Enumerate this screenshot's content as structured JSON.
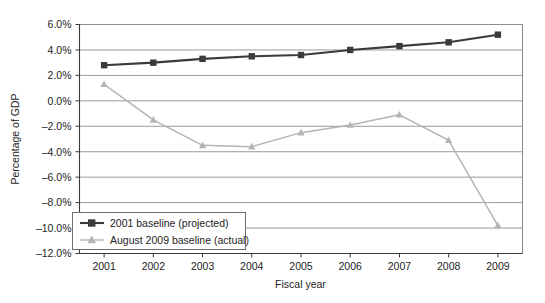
{
  "chart_data": {
    "type": "line",
    "title": "",
    "xlabel": "Fiscal year",
    "ylabel": "Percentage of GDP",
    "categories": [
      "2001",
      "2002",
      "2003",
      "2004",
      "2005",
      "2006",
      "2007",
      "2008",
      "2009"
    ],
    "x": [
      2001,
      2002,
      2003,
      2004,
      2005,
      2006,
      2007,
      2008,
      2009
    ],
    "series": [
      {
        "name": "2001 baseline (projected)",
        "color": "#3a3a3a",
        "marker": "square",
        "values": [
          2.8,
          3.0,
          3.3,
          3.5,
          3.6,
          4.0,
          4.3,
          4.6,
          5.2
        ]
      },
      {
        "name": "August 2009 baseline (actual)",
        "color": "#b4b4b4",
        "marker": "triangle",
        "values": [
          1.3,
          -1.5,
          -3.5,
          -3.6,
          -2.5,
          -1.9,
          -1.1,
          -3.1,
          -9.8
        ]
      }
    ],
    "ylim": [
      -12.0,
      6.0
    ],
    "ytick_values": [
      6.0,
      4.0,
      2.0,
      0.0,
      -2.0,
      -4.0,
      -6.0,
      -8.0,
      -10.0,
      -12.0
    ],
    "ytick_labels": [
      "6.0%",
      "4.0%",
      "2.0%",
      "0.0%",
      "–2.0%",
      "–4.0%",
      "–6.0%",
      "–8.0%",
      "–10.0%",
      "–12.0%"
    ],
    "grid": "horizontal",
    "legend_position": "lower-left-inside",
    "legend_entries": [
      "2001 baseline (projected)",
      "August 2009 baseline (actual)"
    ]
  }
}
